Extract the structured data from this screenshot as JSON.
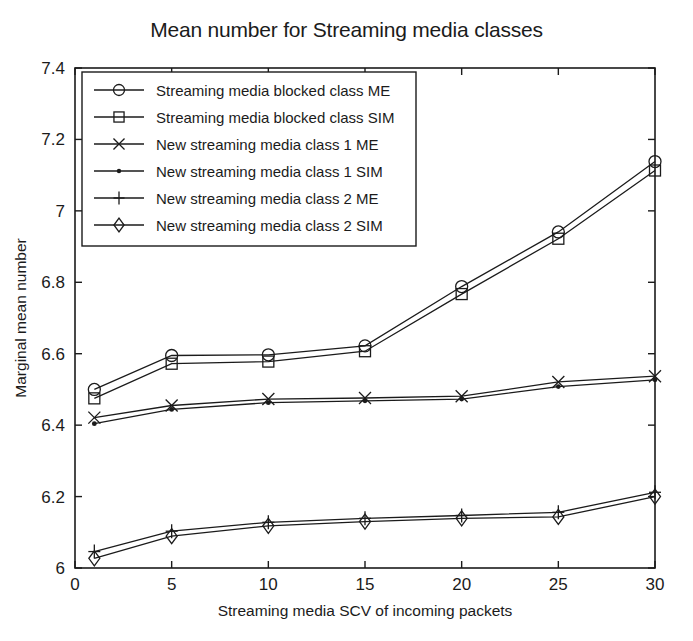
{
  "chart_data": {
    "type": "line",
    "title": "Mean number for Streaming media classes",
    "xlabel": "Streaming media SCV of incoming packets",
    "ylabel": "Marginal mean number",
    "xlim": [
      0,
      30
    ],
    "ylim": [
      6,
      7.4
    ],
    "xticks": [
      0,
      5,
      10,
      15,
      20,
      25,
      30
    ],
    "xticklabels": [
      "0",
      "5",
      "10",
      "15",
      "20",
      "25",
      "30"
    ],
    "yticks": [
      6,
      6.2,
      6.4,
      6.6,
      6.8,
      7,
      7.2,
      7.4
    ],
    "yticklabels": [
      "6",
      "6.2",
      "6.4",
      "6.6",
      "6.8",
      "7",
      "7.2",
      "7.4"
    ],
    "grid": false,
    "legend_position": "upper left",
    "x": [
      1,
      5,
      10,
      15,
      20,
      25,
      30
    ],
    "series": [
      {
        "name": "Streaming media blocked class ME",
        "marker": "circle",
        "values": [
          6.5,
          6.595,
          6.597,
          6.622,
          6.788,
          6.941,
          7.138
        ]
      },
      {
        "name": "Streaming media blocked class SIM",
        "marker": "square",
        "values": [
          6.475,
          6.572,
          6.578,
          6.607,
          6.767,
          6.922,
          7.113
        ]
      },
      {
        "name": "New streaming media class 1 ME",
        "marker": "cross",
        "values": [
          6.421,
          6.455,
          6.473,
          6.476,
          6.481,
          6.521,
          6.537
        ]
      },
      {
        "name": "New streaming media class 1 SIM",
        "marker": "dot",
        "values": [
          6.404,
          6.444,
          6.463,
          6.468,
          6.473,
          6.508,
          6.527
        ]
      },
      {
        "name": "New streaming media class 2 ME",
        "marker": "plus",
        "values": [
          6.046,
          6.103,
          6.128,
          6.139,
          6.147,
          6.156,
          6.212
        ]
      },
      {
        "name": "New streaming media class 2 SIM",
        "marker": "diamond",
        "values": [
          6.027,
          6.089,
          6.118,
          6.13,
          6.139,
          6.143,
          6.2
        ]
      }
    ]
  },
  "colors": {
    "ink": "#1b1b1b",
    "background": "#ffffff"
  }
}
